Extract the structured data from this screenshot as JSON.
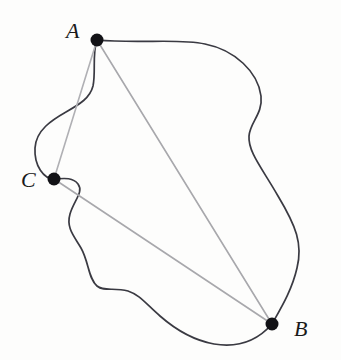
{
  "figure": {
    "type": "geometry-diagram",
    "background_color": "#fdfdfc",
    "curve": {
      "name": "closed-jordan-curve",
      "stroke_color": "#3a3a42",
      "stroke_width": 1.7,
      "fill": "none",
      "path": "M 97 40 C 140 44, 178 38, 205 44 C 235 50, 258 72, 261 96 C 263 114, 250 122, 249 136 C 248 152, 262 168, 278 196 C 296 226, 303 244, 297 268 C 292 290, 281 308, 272 324 C 258 340, 238 348, 214 344 C 192 340, 176 330, 160 316 C 146 304, 140 295, 128 291 C 114 287, 104 292, 97 286 C 88 278, 89 262, 81 248 C 74 236, 66 228, 70 214 C 74 200, 84 192, 78 184 C 72 176, 60 179, 54 179 C 44 179, 34 166, 35 148 C 36 130, 52 120, 66 112 C 80 104, 90 98, 93 86 C 96 72, 92 54, 97 40 Z"
    },
    "chords": [
      {
        "name": "chord-A-B",
        "from": "A",
        "to": "B",
        "x1": 97,
        "y1": 40,
        "x2": 272,
        "y2": 324,
        "stroke_color": "#a8a8ac",
        "stroke_width": 1.6
      },
      {
        "name": "chord-A-C",
        "from": "A",
        "to": "C",
        "x1": 97,
        "y1": 40,
        "x2": 54,
        "y2": 179,
        "stroke_color": "#b0b0b4",
        "stroke_width": 1.6
      },
      {
        "name": "chord-C-B",
        "from": "C",
        "to": "B",
        "x1": 54,
        "y1": 179,
        "x2": 272,
        "y2": 324,
        "stroke_color": "#a8a8ac",
        "stroke_width": 1.6
      }
    ],
    "points": [
      {
        "name": "point-A",
        "label": "A",
        "cx": 97,
        "cy": 40,
        "r": 6.5,
        "color": "#121216",
        "label_x": 66,
        "label_y": 20
      },
      {
        "name": "point-C",
        "label": "C",
        "cx": 54,
        "cy": 179,
        "r": 6.5,
        "color": "#121216",
        "label_x": 21,
        "label_y": 169
      },
      {
        "name": "point-B",
        "label": "B",
        "cx": 272,
        "cy": 324,
        "r": 6.5,
        "color": "#121216",
        "label_x": 294,
        "label_y": 318
      }
    ]
  }
}
